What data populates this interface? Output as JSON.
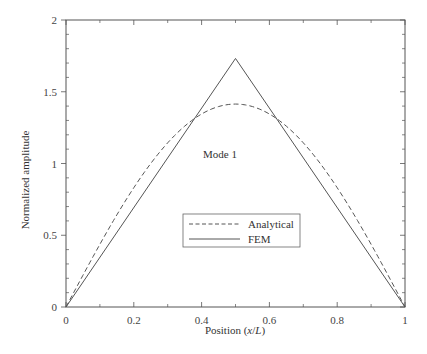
{
  "chart_data": {
    "type": "line",
    "title": "",
    "xlabel": "Position (x/L)",
    "xlabel_parts": [
      "Position (",
      "x",
      "/",
      "L",
      ")"
    ],
    "ylabel": "Normalized amplitude",
    "xlim": [
      0,
      1
    ],
    "ylim": [
      0,
      2
    ],
    "xticks": [
      0,
      0.2,
      0.4,
      0.6,
      0.8,
      1
    ],
    "xtick_labels": [
      "0",
      "0.2",
      "0.4",
      "0.6",
      "0.8",
      "1"
    ],
    "yticks": [
      0,
      0.5,
      1,
      1.5,
      2
    ],
    "ytick_labels": [
      "0",
      "0.5",
      "1",
      "1.5",
      "2"
    ],
    "grid": false,
    "legend_position": "lower center (inside)",
    "annotations": [
      {
        "text": "Mode 1",
        "x": 0.33,
        "y": 1.1
      }
    ],
    "series": [
      {
        "name": "Analytical",
        "style": "dashed",
        "formula": "sqrt(2)*sin(pi*x)",
        "x": [
          0,
          0.05,
          0.1,
          0.15,
          0.2,
          0.25,
          0.3,
          0.35,
          0.4,
          0.45,
          0.5,
          0.55,
          0.6,
          0.65,
          0.7,
          0.75,
          0.8,
          0.85,
          0.9,
          0.95,
          1
        ],
        "values": [
          0,
          0.221,
          0.437,
          0.642,
          0.831,
          1.0,
          1.144,
          1.26,
          1.345,
          1.397,
          1.414,
          1.397,
          1.345,
          1.26,
          1.144,
          1.0,
          0.831,
          0.642,
          0.437,
          0.221,
          0
        ]
      },
      {
        "name": "FEM",
        "style": "solid",
        "x": [
          0,
          0.5,
          1
        ],
        "values": [
          0,
          1.732,
          0
        ]
      }
    ]
  },
  "legend": {
    "items": [
      {
        "label": "Analytical",
        "style": "dashed"
      },
      {
        "label": "FEM",
        "style": "solid"
      }
    ]
  },
  "colors": {
    "axis": "#555555",
    "line": "#555555",
    "text": "#333333"
  }
}
